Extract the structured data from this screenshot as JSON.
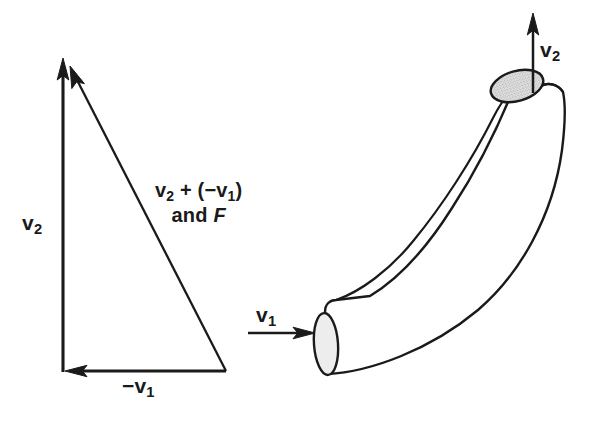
{
  "figure": {
    "background_color": "#ffffff",
    "line_color": "#1a1a1a",
    "opening_fill_color": "#dcdcdc"
  },
  "vector_triangle": {
    "name": "vector-triangle",
    "labels": {
      "v2": {
        "base": "v",
        "sub": "2"
      },
      "minus_v1": {
        "prefix": "−",
        "base": "v",
        "sub": "1"
      },
      "resultant_line1_part1": "v",
      "resultant_line1_sub1": "2",
      "resultant_line1_mid": " + (−",
      "resultant_line1_part2": "v",
      "resultant_line1_sub2": "1",
      "resultant_line1_end": ")",
      "resultant_line2_text": "and ",
      "resultant_line2_italic": "F"
    },
    "vectors": [
      {
        "name": "v2-vertical-arrow",
        "label": "v2",
        "direction": "up"
      },
      {
        "name": "minus-v1-horizontal-arrow",
        "label": "−v1",
        "direction": "left"
      },
      {
        "name": "resultant-arrow",
        "label": "v2 + (−v1) and F",
        "direction": "up-left"
      }
    ]
  },
  "pipe_diagram": {
    "name": "curved-pipe",
    "inlet": {
      "name": "pipe-inlet",
      "label_base": "v",
      "label_sub": "1",
      "arrow_direction": "right"
    },
    "outlet": {
      "name": "pipe-outlet",
      "label_base": "v",
      "label_sub": "2",
      "arrow_direction": "up"
    }
  }
}
